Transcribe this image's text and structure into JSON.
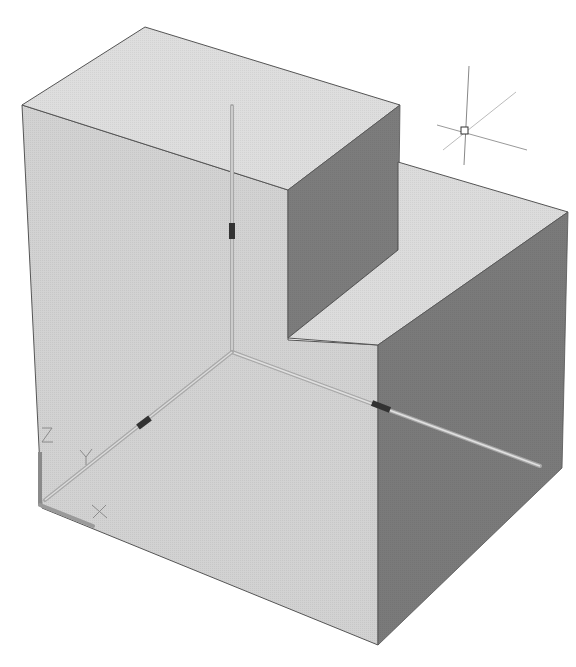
{
  "viewport": {
    "background": "#ffffff",
    "shading": {
      "light_face": "#d4d4d4",
      "top_face": "#dedede",
      "dark_face": "#7a7a7a",
      "edge": "#555555"
    }
  },
  "ucs_icon": {
    "labels": {
      "x": "X",
      "y": "Y",
      "z": "Z"
    },
    "color": "#8a8a8a"
  },
  "gizmo": {
    "axes_color": "#a8a8a8",
    "grip_color": "#333333"
  },
  "cursor": {
    "type": "crosshair-pickbox",
    "color": "#555555"
  }
}
